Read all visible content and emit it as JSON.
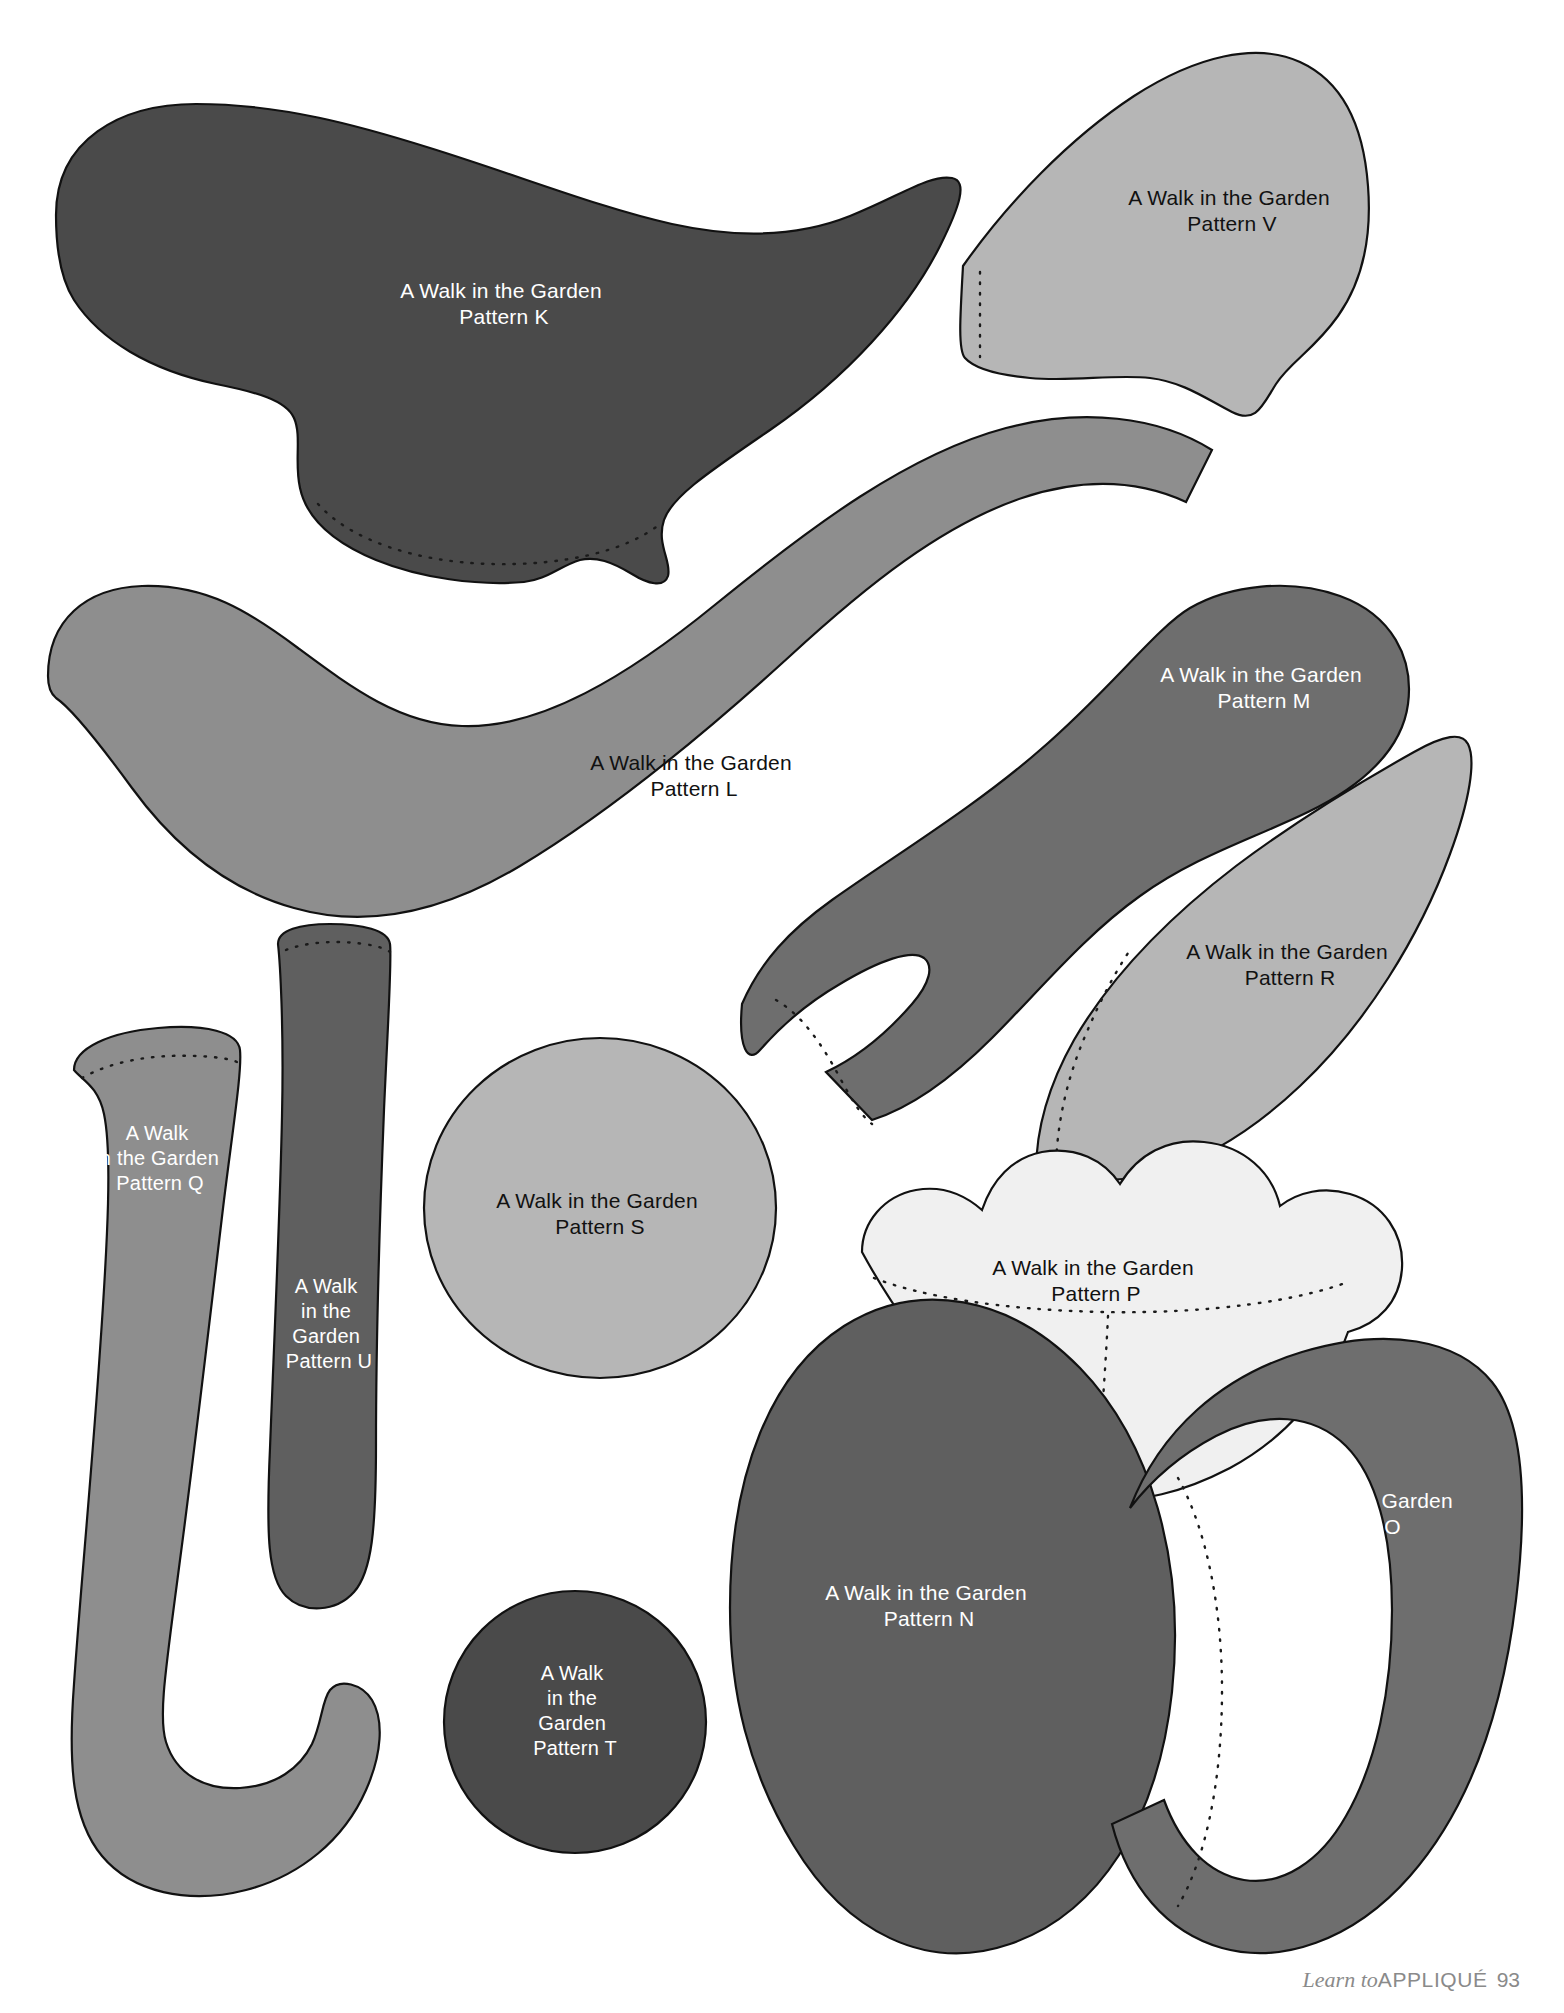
{
  "page": {
    "width": 1564,
    "height": 2013,
    "background": "#ffffff"
  },
  "footer": {
    "book_title_italic": "Learn to",
    "book_title_caps": "APPLIQUÉ",
    "page_number": "93",
    "color": "#8a8a8a"
  },
  "palette": {
    "outline": "#111111",
    "stitch_line": "#1a1a1a",
    "very_dark_gray": "#4a4a4a",
    "dark_gray": "#5f5f5f",
    "mid_gray": "#8e8e8e",
    "light_gray": "#b6b6b6",
    "pale_gray": "#cfcfcf",
    "near_white": "#f0f0f0",
    "white_text": "#ffffff",
    "black_text": "#111111"
  },
  "pieces": [
    {
      "id": "K",
      "name": "pattern-piece-k",
      "fill": "#4a4a4a",
      "text_color": "#ffffff",
      "label_lines": [
        "A Walk in the Garden",
        "Pattern K"
      ],
      "label_x": 504,
      "label_y": 298,
      "has_stitch_line": true
    },
    {
      "id": "V",
      "name": "pattern-piece-v",
      "fill": "#b6b6b6",
      "text_color": "#111111",
      "label_lines": [
        "A Walk in the Garden",
        "Pattern V"
      ],
      "label_x": 1232,
      "label_y": 205,
      "has_stitch_line": true
    },
    {
      "id": "L",
      "name": "pattern-piece-l",
      "fill": "#8e8e8e",
      "text_color": "#111111",
      "label_lines": [
        "A Walk in the Garden",
        "Pattern L"
      ],
      "label_x": 694,
      "label_y": 770,
      "has_stitch_line": false
    },
    {
      "id": "M",
      "name": "pattern-piece-m",
      "fill": "#6e6e6e",
      "text_color": "#ffffff",
      "label_lines": [
        "A Walk in the Garden",
        "Pattern M"
      ],
      "label_x": 1264,
      "label_y": 682,
      "has_stitch_line": true
    },
    {
      "id": "R",
      "name": "pattern-piece-r",
      "fill": "#b6b6b6",
      "text_color": "#111111",
      "label_lines": [
        "A Walk in the Garden",
        "Pattern R"
      ],
      "label_x": 1290,
      "label_y": 959,
      "has_stitch_line": true
    },
    {
      "id": "Q",
      "name": "pattern-piece-q",
      "fill": "#8e8e8e",
      "text_color": "#ffffff",
      "label_lines": [
        "A Walk",
        "in the Garden",
        "Pattern Q"
      ],
      "label_x": 160,
      "label_y": 1140,
      "has_stitch_line": true
    },
    {
      "id": "U",
      "name": "pattern-piece-u",
      "fill": "#5f5f5f",
      "text_color": "#ffffff",
      "label_lines": [
        "A Walk",
        "in the",
        "Garden",
        "Pattern U"
      ],
      "label_x": 329,
      "label_y": 1293,
      "has_stitch_line": true
    },
    {
      "id": "S",
      "name": "pattern-piece-s",
      "fill": "#b6b6b6",
      "text_color": "#111111",
      "label_lines": [
        "A Walk in the Garden",
        "Pattern S"
      ],
      "label_x": 600,
      "label_y": 1208,
      "has_stitch_line": false
    },
    {
      "id": "P",
      "name": "pattern-piece-p",
      "fill": "#f0f0f0",
      "text_color": "#111111",
      "label_lines": [
        "A Walk in the Garden",
        "Pattern P"
      ],
      "label_x": 1096,
      "label_y": 1275,
      "has_stitch_line": true
    },
    {
      "id": "N",
      "name": "pattern-piece-n",
      "fill": "#5f5f5f",
      "text_color": "#ffffff",
      "label_lines": [
        "A Walk in the Garden",
        "Pattern N"
      ],
      "label_x": 929,
      "label_y": 1600,
      "has_stitch_line": false
    },
    {
      "id": "O",
      "name": "pattern-piece-o",
      "fill": "#6e6e6e",
      "text_color": "#ffffff",
      "label_lines": [
        "A Walk in the Garden",
        "Pattern O"
      ],
      "label_x": 1355,
      "label_y": 1508,
      "has_stitch_line": true
    },
    {
      "id": "T",
      "name": "pattern-piece-t",
      "fill": "#4a4a4a",
      "text_color": "#ffffff",
      "label_lines": [
        "A Walk",
        "in the",
        "Garden",
        "Pattern T"
      ],
      "label_x": 575,
      "label_y": 1680,
      "has_stitch_line": false
    }
  ]
}
